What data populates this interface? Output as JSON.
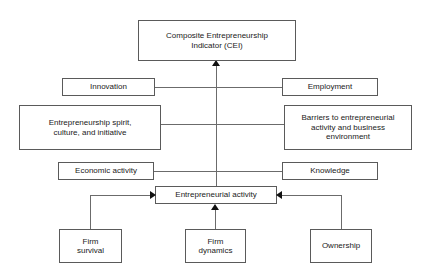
{
  "diagram": {
    "title_box": {
      "label": "Composite Entrepreneurship\nIndicator (CEI)"
    },
    "left_column": [
      {
        "label": "Innovation"
      },
      {
        "label": "Entrepreneurship spirit,\nculture, and initiative"
      },
      {
        "label": "Economic activity"
      }
    ],
    "right_column": [
      {
        "label": "Employment"
      },
      {
        "label": "Barriers to entrepreneurial\nactivity and business\nenvironment"
      },
      {
        "label": "Knowledge"
      }
    ],
    "center_box": {
      "label": "Entrepreneurial activity"
    },
    "bottom_row": [
      {
        "label": "Firm\nsurvival"
      },
      {
        "label": "Firm\ndynamics"
      },
      {
        "label": "Ownership"
      }
    ],
    "colors": {
      "box_border": "#5a5a5a",
      "connector": "#6b6b6b",
      "arrowhead": "#111111",
      "text": "#1a1a1a",
      "background": "#ffffff"
    }
  }
}
